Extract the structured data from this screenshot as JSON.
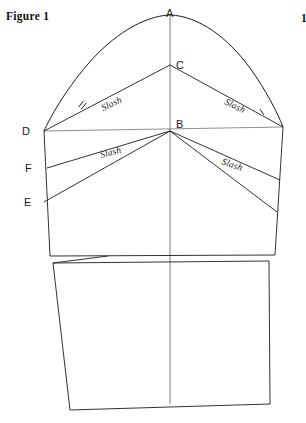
{
  "figure": {
    "caption": "Figure 1",
    "edge_fragment": "1"
  },
  "points": [
    {
      "id": "A",
      "label": "A",
      "x": 170,
      "y": 15,
      "tx": 166,
      "ty": 17,
      "desc": "sleeve cap apex / shoulder point"
    },
    {
      "id": "C",
      "label": "C",
      "x": 170,
      "y": 65,
      "tx": 176,
      "ty": 69,
      "desc": "upper slash pivot"
    },
    {
      "id": "B",
      "label": "B",
      "x": 170,
      "y": 131,
      "tx": 176,
      "ty": 128,
      "desc": "lower slash pivot on biceps line"
    },
    {
      "id": "D",
      "label": "D",
      "x": 44,
      "y": 131,
      "tx": 22,
      "ty": 135,
      "desc": "left biceps line end"
    },
    {
      "id": "F",
      "label": "F",
      "x": 47,
      "y": 168,
      "tx": 25,
      "ty": 172,
      "desc": "left second slash origin"
    },
    {
      "id": "E",
      "label": "E",
      "x": 44,
      "y": 202,
      "tx": 24,
      "ty": 206,
      "desc": "left third slash origin"
    }
  ],
  "slash_labels": [
    {
      "id": "slash-upper-left",
      "text": "Slash",
      "x": 103,
      "y": 111,
      "rotate": -25
    },
    {
      "id": "slash-upper-right",
      "text": "Slash",
      "x": 224,
      "y": 104,
      "rotate": 25
    },
    {
      "id": "slash-lower-left",
      "text": "Slash",
      "x": 101,
      "y": 158,
      "rotate": -15
    },
    {
      "id": "slash-lower-right",
      "text": "Slash",
      "x": 221,
      "y": 164,
      "rotate": 19
    }
  ],
  "geometry": {
    "cap_curve_left": "M 44 131 C 50 118, 64 92, 88 64 C 112 36, 143 16, 170 15",
    "cap_curve_right": "M 170 15 C 199 16, 228 38, 250 68 C 266 90, 278 114, 283 127",
    "center_line": "M 170 15 L 170 404",
    "biceps_line": "M 44 131 L 283 127",
    "slash_C_left": "M 170 65 L 44 131",
    "slash_C_right": "M 170 65 L 283 127",
    "slash_B_left": "M 170 131 L 47 168",
    "slash_B_right": "M 170 131 L 280 180",
    "slash_B_left2": "M 170 131 L 44 202",
    "slash_B_right2": "M 170 131 L 277 212",
    "left_seam_upper": "M 44 131 L 50 256",
    "right_seam_upper": "M 283 127 L 275 255",
    "elbow_line": "M 50 256 L 275 255",
    "lower_panel": "M 53 263 L 269 261 L 270 404 L 70 410 Z",
    "wedge_line": "M 53 263 L 108 256",
    "left_seam_lower": "M 53 263 L 70 410",
    "right_seam_lower": "M 269 261 L 270 404",
    "hem_line": "M 70 410 L 270 404"
  },
  "notches": [
    {
      "id": "notch-left-double",
      "x": 81,
      "y": 104,
      "rotate": -52,
      "strokes": 2
    },
    {
      "id": "notch-right-single",
      "x": 262,
      "y": 112,
      "rotate": 55,
      "strokes": 1
    }
  ],
  "colors": {
    "ink": "#1b1b1b",
    "grey_line": "#8f8f8f",
    "center_line": "#6f6f6f",
    "background": "#ffffff",
    "text": "#1a1a1a"
  }
}
